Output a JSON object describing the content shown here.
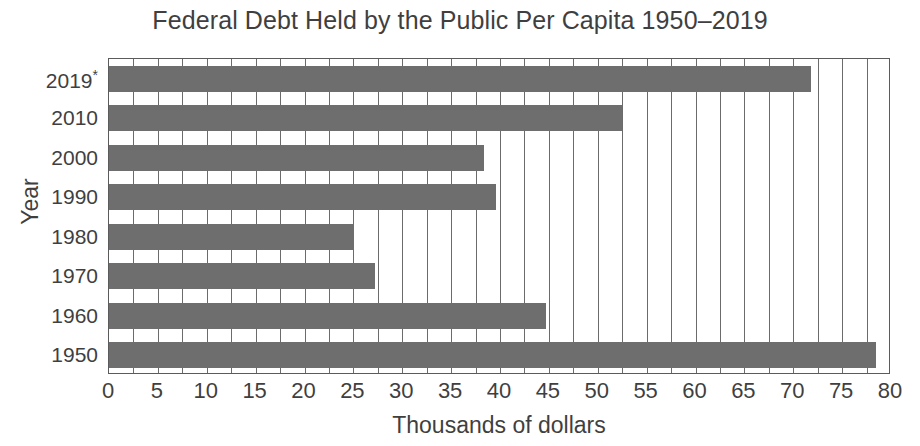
{
  "chart_data": {
    "type": "bar",
    "orientation": "horizontal",
    "title": "Federal Debt Held by the Public Per Capita 1950–2019",
    "xlabel": "Thousands of dollars",
    "ylabel": "Year",
    "categories": [
      "2019*",
      "2010",
      "2000",
      "1990",
      "1980",
      "1970",
      "1960",
      "1950"
    ],
    "values": [
      71.8,
      52.5,
      38.4,
      39.6,
      25.1,
      27.2,
      44.7,
      78.5
    ],
    "xlim": [
      0,
      80
    ],
    "xticks": [
      0,
      5,
      10,
      15,
      20,
      25,
      30,
      35,
      40,
      45,
      50,
      55,
      60,
      65,
      70,
      75,
      80
    ],
    "xtick_labels": [
      "0",
      "5",
      "10",
      "15",
      "20",
      "25",
      "30",
      "35",
      "40",
      "45",
      "50",
      "55",
      "60",
      "65",
      "70",
      "75",
      "80"
    ],
    "grid": "vertical-major-and-minor",
    "legend": null,
    "bar_color": "#6e6e6e",
    "axis_color": "#5b5b5b",
    "text_color": "#3f3f3f",
    "background_color": "#ffffff"
  },
  "artifact": {
    "bottom_text": ""
  }
}
